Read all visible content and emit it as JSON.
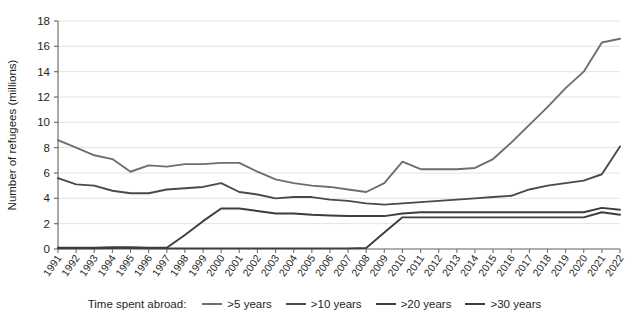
{
  "chart_data": {
    "type": "line",
    "title": "",
    "xlabel": "",
    "ylabel": "Number of refugees (millions)",
    "ylim": [
      0,
      18
    ],
    "yticks": [
      0,
      2,
      4,
      6,
      8,
      10,
      12,
      14,
      16,
      18
    ],
    "grid": true,
    "legend_position": "bottom",
    "legend_title": "Time spent abroad:",
    "categories": [
      "1991",
      "1992",
      "1993",
      "1994",
      "1995",
      "1996",
      "1997",
      "1998",
      "1999",
      "2000",
      "2001",
      "2002",
      "2003",
      "2004",
      "2005",
      "2006",
      "2007",
      "2008",
      "2009",
      "2010",
      "2011",
      "2012",
      "2013",
      "2014",
      "2015",
      "2016",
      "2017",
      "2018",
      "2019",
      "2020",
      "2021",
      "2022"
    ],
    "series": [
      {
        "name": ">5 years",
        "color": "#6e6e6e",
        "values": [
          8.6,
          8.0,
          7.4,
          7.1,
          6.1,
          6.6,
          6.5,
          6.7,
          6.7,
          6.8,
          6.8,
          6.1,
          5.5,
          5.2,
          5.0,
          4.9,
          4.7,
          4.5,
          5.2,
          6.9,
          6.3,
          6.3,
          6.3,
          6.4,
          7.1,
          8.4,
          9.8,
          11.2,
          12.7,
          14.0,
          16.3,
          16.6
        ]
      },
      {
        "name": ">10 years",
        "color": "#4a4a4a",
        "values": [
          5.6,
          5.1,
          5.0,
          4.6,
          4.4,
          4.4,
          4.7,
          4.8,
          4.9,
          5.2,
          4.5,
          4.3,
          4.0,
          4.1,
          4.1,
          3.9,
          3.8,
          3.6,
          3.5,
          3.6,
          3.7,
          3.8,
          3.9,
          4.0,
          4.1,
          4.2,
          4.7,
          5.0,
          5.2,
          5.4,
          5.9,
          8.1
        ]
      },
      {
        "name": ">20 years",
        "color": "#3d3d3d",
        "values": [
          0.1,
          0.1,
          0.1,
          0.15,
          0.15,
          0.1,
          0.1,
          1.1,
          2.2,
          3.2,
          3.2,
          3.0,
          2.8,
          2.8,
          2.7,
          2.65,
          2.6,
          2.6,
          2.6,
          2.8,
          2.9,
          2.9,
          2.9,
          2.9,
          2.9,
          2.9,
          2.9,
          2.9,
          2.9,
          2.9,
          3.25,
          3.1
        ]
      },
      {
        "name": ">30 years",
        "color": "#3d3d3d",
        "values": [
          0.05,
          0.05,
          0.05,
          0.08,
          0.08,
          0.05,
          0.05,
          0.05,
          0.05,
          0.05,
          0.05,
          0.05,
          0.05,
          0.05,
          0.05,
          0.05,
          0.05,
          0.08,
          1.3,
          2.5,
          2.5,
          2.5,
          2.5,
          2.5,
          2.5,
          2.5,
          2.5,
          2.5,
          2.5,
          2.5,
          2.9,
          2.7
        ]
      }
    ]
  },
  "legend": {
    "title": "Time spent abroad:",
    "entries": [
      {
        "label": ">5 years",
        "color": "#6e6e6e"
      },
      {
        "label": ">10 years",
        "color": "#4a4a4a"
      },
      {
        "label": ">20 years",
        "color": "#3d3d3d"
      },
      {
        "label": ">30 years",
        "color": "#3d3d3d"
      }
    ]
  },
  "axes": {
    "y_title": "Number of refugees (millions)"
  },
  "colors": {
    "grid": "#e2e2e2",
    "axis": "#6f6f6f",
    "text": "#231f20"
  }
}
